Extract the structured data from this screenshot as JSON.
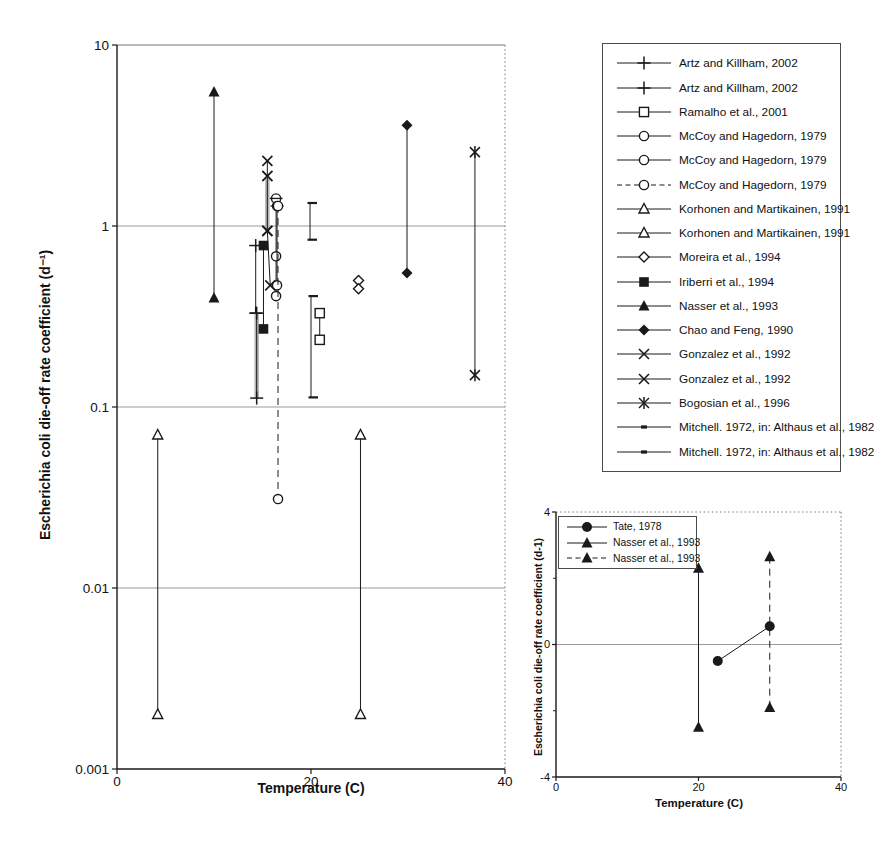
{
  "colors": {
    "ink": "#1a1a1a",
    "grid": "#9a9a9a",
    "frame": "#777777",
    "underlay": "#b5b5b5"
  },
  "chart_data": [
    {
      "id": "main",
      "type": "scatter",
      "title": "",
      "xlabel": "Temperature (C)",
      "ylabel": "Escherichia coli die-off rate coefficient (d⁻¹)",
      "yscale": "log",
      "xlim": [
        0,
        40
      ],
      "ylim": [
        0.001,
        10
      ],
      "xticks": [
        "0",
        "20",
        "40"
      ],
      "yticks": [
        "10",
        "1",
        "0.1",
        "0.01",
        "0.001"
      ],
      "grid_y": [
        1,
        0.1,
        0.01
      ],
      "legend_position": "outside-right",
      "legend": [
        {
          "label": "Artz and Killham, 2002",
          "marker": "plus",
          "line": "solid"
        },
        {
          "label": "Artz and Killham, 2002",
          "marker": "plus",
          "line": "solid"
        },
        {
          "label": "Ramalho et al., 2001",
          "marker": "square-open",
          "line": "solid"
        },
        {
          "label": "McCoy and Hagedorn, 1979",
          "marker": "circle-open",
          "line": "solid"
        },
        {
          "label": "McCoy and Hagedorn, 1979",
          "marker": "circle-open",
          "line": "solid"
        },
        {
          "label": "McCoy and Hagedorn, 1979",
          "marker": "circle-open",
          "line": "dashed"
        },
        {
          "label": "Korhonen and Martikainen, 1991",
          "marker": "triangle-open",
          "line": "solid"
        },
        {
          "label": "Korhonen and Martikainen, 1991",
          "marker": "triangle-open",
          "line": "solid"
        },
        {
          "label": "Moreira et al., 1994",
          "marker": "diamond-open",
          "line": "solid"
        },
        {
          "label": "Iriberri et al., 1994",
          "marker": "square-filled",
          "line": "solid"
        },
        {
          "label": "Nasser et al., 1993",
          "marker": "triangle-filled",
          "line": "solid"
        },
        {
          "label": "Chao and Feng, 1990",
          "marker": "diamond-filled",
          "line": "solid"
        },
        {
          "label": "Gonzalez et al., 1992",
          "marker": "x",
          "line": "solid"
        },
        {
          "label": "Gonzalez et al., 1992",
          "marker": "x",
          "line": "solid"
        },
        {
          "label": "Bogosian et al., 1996",
          "marker": "asterisk",
          "line": "solid"
        },
        {
          "label": "Mitchell. 1972, in: Althaus et al., 1982",
          "marker": "dash",
          "line": "solid"
        },
        {
          "label": "Mitchell. 1972, in: Althaus et al., 1982",
          "marker": "dash",
          "line": "solid"
        }
      ],
      "series": [
        {
          "name": "Artz and Killham, 2002",
          "marker": "plus",
          "line": "solid",
          "points": [
            [
              14.3,
              0.78
            ],
            [
              14.3,
              0.33
            ]
          ]
        },
        {
          "name": "Artz and Killham, 2002",
          "marker": "plus",
          "line": "solid",
          "underlay": true,
          "points": [
            [
              14.4,
              0.33
            ],
            [
              14.4,
              0.112
            ]
          ]
        },
        {
          "name": "Ramalho et al., 2001",
          "marker": "square-open",
          "line": "solid",
          "points": [
            [
              20.9,
              0.33
            ],
            [
              20.9,
              0.235
            ]
          ]
        },
        {
          "name": "McCoy and Hagedorn, 1979",
          "marker": "circle-open",
          "line": "solid",
          "point_markers": [
            "circle-dash",
            "circle-open",
            "circle-open"
          ],
          "points": [
            [
              16.4,
              1.42
            ],
            [
              16.4,
              0.68
            ],
            [
              16.4,
              0.41
            ]
          ]
        },
        {
          "name": "McCoy and Hagedorn, 1979",
          "marker": "circle-open",
          "line": "solid",
          "point_markers": [
            "circle-dash",
            "circle-open"
          ],
          "points": [
            [
              16.5,
              1.29
            ],
            [
              16.5,
              0.47
            ]
          ]
        },
        {
          "name": "McCoy and Hagedorn, 1979",
          "marker": "circle-open",
          "line": "dashed",
          "points": [
            [
              16.6,
              1.29
            ],
            [
              16.6,
              0.031
            ]
          ]
        },
        {
          "name": "Korhonen and Martikainen, 1991",
          "marker": "triangle-open",
          "line": "solid",
          "points": [
            [
              4.2,
              0.07
            ],
            [
              4.2,
              0.002
            ]
          ]
        },
        {
          "name": "Korhonen and Martikainen, 1991",
          "marker": "triangle-open",
          "line": "solid",
          "points": [
            [
              25.1,
              0.07
            ],
            [
              25.1,
              0.002
            ]
          ]
        },
        {
          "name": "Moreira et al., 1994",
          "marker": "diamond-open",
          "line": "solid",
          "points": [
            [
              24.9,
              0.5
            ],
            [
              24.9,
              0.45
            ]
          ]
        },
        {
          "name": "Iriberri et al., 1994",
          "marker": "square-filled",
          "line": "solid",
          "points": [
            [
              15.1,
              0.78
            ],
            [
              15.1,
              0.27
            ]
          ]
        },
        {
          "name": "Nasser et al., 1993",
          "marker": "triangle-filled",
          "line": "solid",
          "points": [
            [
              10,
              5.5
            ],
            [
              10,
              0.4
            ]
          ]
        },
        {
          "name": "Chao and Feng, 1990",
          "marker": "diamond-filled",
          "line": "solid",
          "points": [
            [
              29.9,
              3.6
            ],
            [
              29.9,
              0.55
            ]
          ]
        },
        {
          "name": "Gonzalez et al., 1992",
          "marker": "x",
          "line": "solid",
          "points": [
            [
              15.5,
              2.29
            ],
            [
              15.5,
              1.89
            ]
          ]
        },
        {
          "name": "Gonzalez et al., 1992",
          "marker": "x",
          "line": "solid",
          "underlay": true,
          "points": [
            [
              15.5,
              1.89
            ],
            [
              15.5,
              0.94
            ]
          ]
        },
        {
          "name": "Gonzalez et al., 1992",
          "marker": "x",
          "line": "solid",
          "points": [
            [
              15.5,
              0.94
            ],
            [
              15.8,
              0.47
            ]
          ]
        },
        {
          "name": "Bogosian et al., 1996",
          "marker": "asterisk",
          "line": "solid",
          "points": [
            [
              36.9,
              2.56
            ],
            [
              36.9,
              0.15
            ]
          ]
        },
        {
          "name": "Mitchell. 1972, in: Althaus et al., 1982",
          "marker": "bracket",
          "line": "solid",
          "points": [
            [
              19.9,
              1.34
            ],
            [
              19.9,
              0.84
            ]
          ]
        },
        {
          "name": "Mitchell. 1972, in: Althaus et al., 1982",
          "marker": "bracket",
          "line": "solid",
          "points": [
            [
              20.0,
              0.41
            ],
            [
              20.0,
              0.113
            ]
          ]
        }
      ]
    },
    {
      "id": "inset",
      "type": "scatter",
      "title": "",
      "xlabel": "Temperature (C)",
      "ylabel": "Escherichia coli die-off rate coefficient (d-1)",
      "yscale": "linear",
      "xlim": [
        0,
        40
      ],
      "ylim": [
        -4,
        4
      ],
      "xticks": [
        "0",
        "20",
        "40"
      ],
      "yticks": [
        "4",
        "0",
        "-4"
      ],
      "yticks_minor": [
        2,
        -2
      ],
      "grid_y": [
        0
      ],
      "legend_position": "inside-top-left",
      "legend": [
        {
          "label": "Tate, 1978",
          "marker": "circle-filled",
          "line": "solid"
        },
        {
          "label": "Nasser et al., 1993",
          "marker": "triangle-filled",
          "line": "solid"
        },
        {
          "label": "Nasser et al., 1993",
          "marker": "triangle-filled",
          "line": "dashed"
        }
      ],
      "series": [
        {
          "name": "Tate, 1978",
          "marker": "circle-filled",
          "line": "solid",
          "points": [
            [
              22.7,
              -0.5
            ],
            [
              30,
              0.55
            ]
          ]
        },
        {
          "name": "Nasser et al., 1993",
          "marker": "triangle-filled",
          "line": "solid",
          "points": [
            [
              20,
              2.3
            ],
            [
              20,
              -2.5
            ]
          ]
        },
        {
          "name": "Nasser et al., 1993",
          "marker": "triangle-filled",
          "line": "dashed",
          "points": [
            [
              30,
              2.65
            ],
            [
              30,
              -1.9
            ]
          ]
        }
      ]
    }
  ]
}
